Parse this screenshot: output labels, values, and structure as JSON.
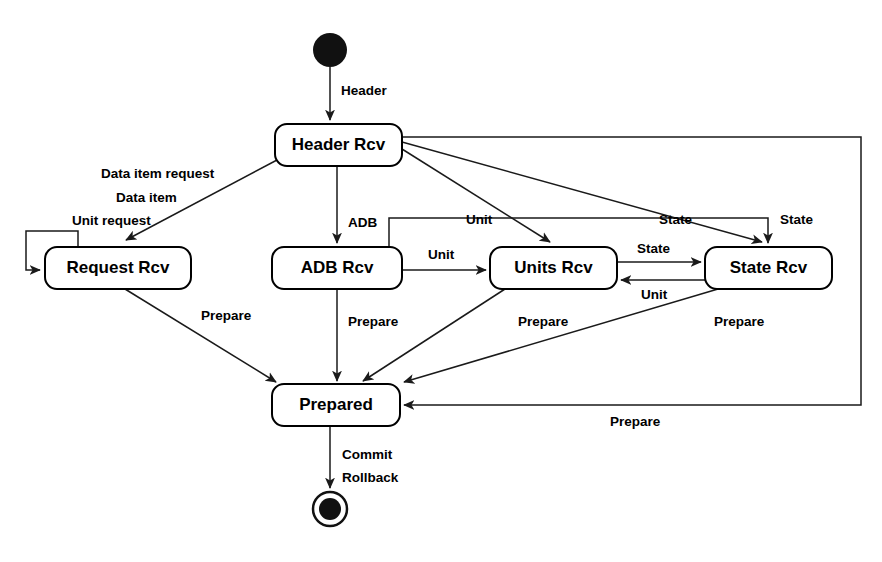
{
  "diagram": {
    "type": "uml-state-machine",
    "states": [
      {
        "id": "initial",
        "label": "",
        "kind": "initial-pseudostate",
        "x": 330,
        "y": 50,
        "r": 17
      },
      {
        "id": "header_rcv",
        "label": "Header Rcv",
        "kind": "state",
        "x": 275,
        "y": 124,
        "w": 127,
        "h": 42
      },
      {
        "id": "request_rcv",
        "label": "Request Rcv",
        "kind": "state",
        "x": 45,
        "y": 247,
        "w": 146,
        "h": 42
      },
      {
        "id": "adb_rcv",
        "label": "ADB Rcv",
        "kind": "state",
        "x": 272,
        "y": 247,
        "w": 130,
        "h": 42
      },
      {
        "id": "units_rcv",
        "label": "Units Rcv",
        "kind": "state",
        "x": 490,
        "y": 247,
        "w": 127,
        "h": 42
      },
      {
        "id": "state_rcv",
        "label": "State Rcv",
        "kind": "state",
        "x": 705,
        "y": 247,
        "w": 127,
        "h": 42
      },
      {
        "id": "prepared",
        "label": "Prepared",
        "kind": "state",
        "x": 272,
        "y": 384,
        "w": 128,
        "h": 42
      },
      {
        "id": "final",
        "label": "",
        "kind": "final-state",
        "x": 330,
        "y": 509,
        "r_outer": 17,
        "r_inner": 11
      }
    ],
    "transitions": [
      {
        "from": "initial",
        "to": "header_rcv",
        "label": "Header"
      },
      {
        "from": "header_rcv",
        "to": "request_rcv",
        "label": "Data item request"
      },
      {
        "from": "request_rcv",
        "to": "request_rcv",
        "label": "Data item"
      },
      {
        "from": "request_rcv",
        "to": "request_rcv",
        "label": "Unit request"
      },
      {
        "from": "header_rcv",
        "to": "adb_rcv",
        "label": "ADB"
      },
      {
        "from": "header_rcv",
        "to": "units_rcv",
        "label": "Unit"
      },
      {
        "from": "header_rcv",
        "to": "state_rcv",
        "label": "State"
      },
      {
        "from": "adb_rcv",
        "to": "units_rcv",
        "label": "Unit"
      },
      {
        "from": "adb_rcv",
        "to": "state_rcv",
        "label": "State"
      },
      {
        "from": "units_rcv",
        "to": "state_rcv",
        "label": "State"
      },
      {
        "from": "state_rcv",
        "to": "units_rcv",
        "label": "Unit"
      },
      {
        "from": "request_rcv",
        "to": "prepared",
        "label": "Prepare"
      },
      {
        "from": "adb_rcv",
        "to": "prepared",
        "label": "Prepare"
      },
      {
        "from": "units_rcv",
        "to": "prepared",
        "label": "Prepare"
      },
      {
        "from": "state_rcv",
        "to": "prepared",
        "label": "Prepare"
      },
      {
        "from": "prepared",
        "to": "header_rcv",
        "label": "Prepare"
      },
      {
        "from": "prepared",
        "to": "final",
        "label": "Commit"
      },
      {
        "from": "prepared",
        "to": "final",
        "label": "Rollback"
      }
    ],
    "labels": {
      "header": "Header",
      "data_item_request": "Data item request",
      "data_item": "Data item",
      "unit_request": "Unit request",
      "adb": "ADB",
      "unit_top": "Unit",
      "state_top": "State",
      "state_down": "State",
      "unit_mid": "Unit",
      "state_mid": "State",
      "unit_back": "Unit",
      "prepare_request": "Prepare",
      "prepare_adb": "Prepare",
      "prepare_units": "Prepare",
      "prepare_state": "Prepare",
      "prepare_return": "Prepare",
      "commit": "Commit",
      "rollback": "Rollback"
    },
    "colors": {
      "stroke": "#000000",
      "fill": "#ffffff",
      "text": "#000000",
      "pseudostate": "#111111"
    }
  }
}
